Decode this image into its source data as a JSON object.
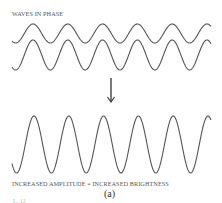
{
  "title": "WAVES IN PHASE",
  "result_label": "INCREASED AMPLITUDE = INCREASED BRIGHTNESS",
  "panel_label": "(a)",
  "cut_fragment": "L. 12",
  "colors": {
    "wave": "#555555",
    "arrow": "#333333",
    "text": "#555555"
  },
  "waves": {
    "wavelength_px": 34.8,
    "top_wave": {
      "amplitude_px": 9.5,
      "center_y": 33.5,
      "first_peak_x": 33
    },
    "second_wave": {
      "amplitude_px": 15,
      "center_y": 55,
      "first_peak_x": 33
    },
    "combined_wave": {
      "amplitude_px": 28.5,
      "center_y": 144.5,
      "first_peak_x": 34
    }
  }
}
